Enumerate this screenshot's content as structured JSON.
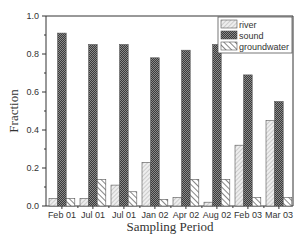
{
  "chart_data": {
    "type": "bar",
    "title": "",
    "xlabel": "Sampling Period",
    "ylabel": "Fraction",
    "ylim": [
      0.0,
      1.0
    ],
    "yticks": [
      "0.0",
      "0.2",
      "0.4",
      "0.6",
      "0.8",
      "1.0"
    ],
    "grid": false,
    "legend_position": "upper right",
    "categories": [
      "Feb 01",
      "Jul 01",
      "Jul 01",
      "Jan 02",
      "Apr 02",
      "Aug 02",
      "Feb 03",
      "Mar 03"
    ],
    "series": [
      {
        "name": "river",
        "pattern": "light-hatch",
        "color": "#cfcfcf",
        "values": [
          0.04,
          0.04,
          0.11,
          0.23,
          0.045,
          0.02,
          0.32,
          0.45
        ]
      },
      {
        "name": "sound",
        "pattern": "dark-crosshatch",
        "color": "#555555",
        "values": [
          0.91,
          0.85,
          0.85,
          0.78,
          0.82,
          0.85,
          0.69,
          0.55
        ]
      },
      {
        "name": "groundwater",
        "pattern": "diagonal-hatch",
        "color": "#ffffff",
        "values": [
          0.04,
          0.14,
          0.075,
          0.035,
          0.14,
          0.14,
          0.045,
          0.045
        ]
      }
    ]
  }
}
